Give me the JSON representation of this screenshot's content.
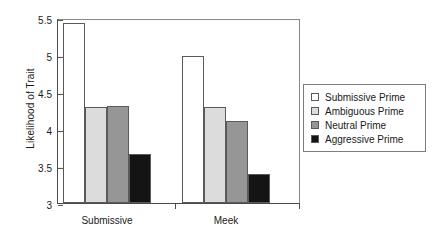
{
  "chart_data": {
    "type": "bar",
    "title": "",
    "xlabel": "",
    "ylabel": "Likelihood of Trait",
    "categories": [
      "Submissive",
      "Meek"
    ],
    "ylim": [
      3,
      5.5
    ],
    "yticks": [
      "3",
      "3.5",
      "4",
      "4.5",
      "5",
      "5.5"
    ],
    "ytick_values": [
      3,
      3.5,
      4,
      4.5,
      5,
      5.5
    ],
    "grid": false,
    "legend_position": "right",
    "series": [
      {
        "name": "Submissive Prime",
        "color": "#ffffff",
        "values": [
          5.43,
          4.99
        ]
      },
      {
        "name": "Ambiguous Prime",
        "color": "#dcdcdc",
        "values": [
          4.3,
          4.3
        ]
      },
      {
        "name": "Neutral Prime",
        "color": "#969696",
        "values": [
          4.31,
          4.11
        ]
      },
      {
        "name": "Aggressive Prime",
        "color": "#141414",
        "values": [
          3.66,
          3.39
        ]
      }
    ]
  },
  "legend": {
    "items": [
      {
        "label": "Submissive Prime",
        "swatch": "#ffffff"
      },
      {
        "label": "Ambiguous Prime",
        "swatch": "#dcdcdc"
      },
      {
        "label": "Neutral Prime",
        "swatch": "#969696"
      },
      {
        "label": "Aggressive Prime",
        "swatch": "#141414"
      }
    ]
  }
}
